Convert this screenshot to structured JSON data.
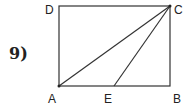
{
  "problem": {
    "number": "9)"
  },
  "diagram": {
    "type": "geometry",
    "shape": "rectangle ABCD with segments AC and EC",
    "points": {
      "A": {
        "label": "A",
        "x": 59,
        "y": 86
      },
      "B": {
        "label": "B",
        "x": 170,
        "y": 86
      },
      "C": {
        "label": "C",
        "x": 170,
        "y": 6
      },
      "D": {
        "label": "D",
        "x": 59,
        "y": 6
      },
      "E": {
        "label": "E",
        "x": 114,
        "y": 86
      }
    },
    "segments": [
      "AB",
      "BC",
      "CD",
      "DA",
      "AC",
      "EC"
    ],
    "stroke_color": "#333333"
  }
}
